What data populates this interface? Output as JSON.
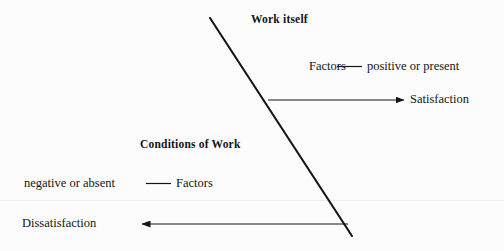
{
  "diagram": {
    "ink_color": "#151515",
    "background_color": "#fcfcfc",
    "headings": {
      "top": "Work itself",
      "bottom": "Conditions of Work"
    },
    "positive_row": {
      "source": "Factors",
      "connector": "line",
      "condition": "positive or present"
    },
    "positive_outcome": "Satisfaction",
    "negative_row": {
      "condition": "negative or absent",
      "connector": "line",
      "source": "Factors"
    },
    "negative_outcome": "Dissatisfaction",
    "divider_line": {
      "start": [
        210,
        18
      ],
      "end": [
        352,
        236
      ]
    },
    "arrows": [
      {
        "name": "satisfaction-arrow",
        "from": [
          268,
          100
        ],
        "to": [
          406,
          100
        ],
        "direction": "right"
      },
      {
        "name": "dissatisfaction-arrow",
        "from": [
          348,
          224
        ],
        "to": [
          140,
          224
        ],
        "direction": "left"
      }
    ],
    "connectors": [
      {
        "name": "positive-connector",
        "x1": 337,
        "x2": 362,
        "y": 66
      },
      {
        "name": "negative-connector",
        "x1": 146,
        "x2": 171,
        "y": 183
      }
    ]
  }
}
